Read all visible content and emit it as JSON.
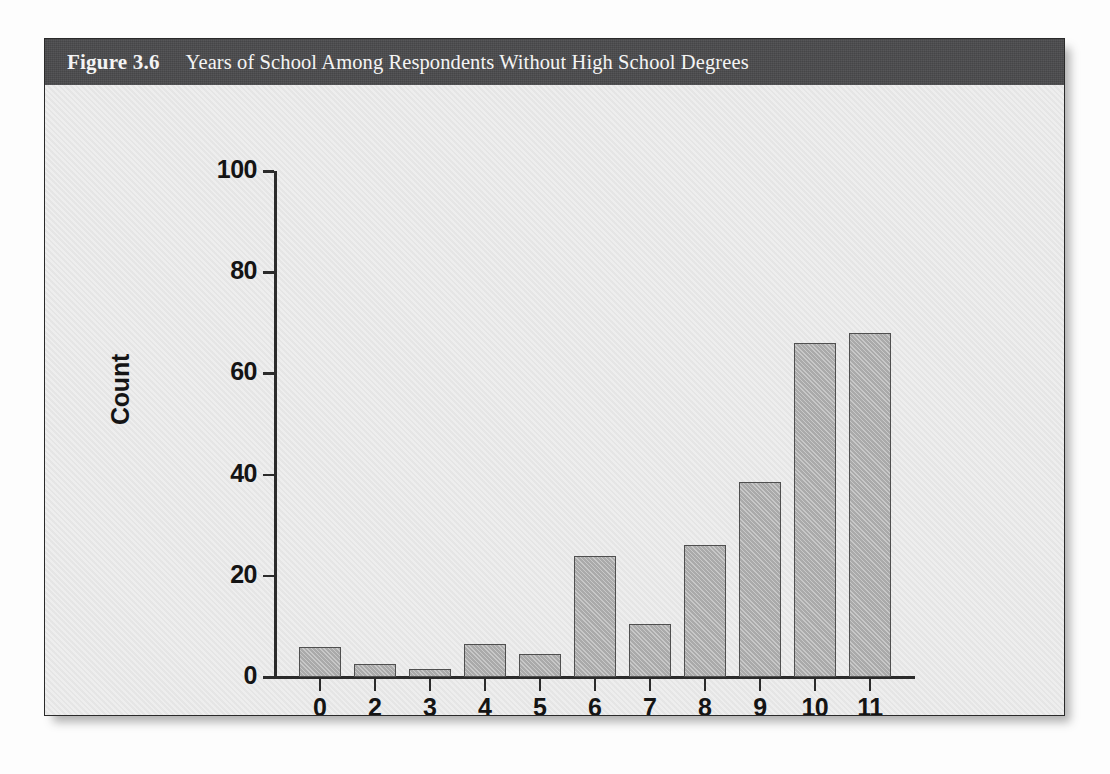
{
  "figure": {
    "number": "Figure 3.6",
    "title": "Years of School Among Respondents Without High School Degrees",
    "caption_bar_color": "#4a4a4c",
    "panel_color": "#e8e8e8",
    "bar_fill_color": "#b3b3b3",
    "bar_edge_color": "#4f4f4f",
    "axis_color": "#2b2b2b"
  },
  "chart_data": {
    "type": "bar",
    "title": "Years of School Among Respondents Without High School Degrees",
    "xlabel": "Highest Year of School Completed",
    "ylabel": "Count",
    "categories": [
      "0",
      "2",
      "3",
      "4",
      "5",
      "6",
      "7",
      "8",
      "9",
      "10",
      "11"
    ],
    "values": [
      6,
      2.5,
      1.5,
      6.5,
      4.5,
      24,
      10.5,
      26,
      38.5,
      66,
      68
    ],
    "ylim": [
      0,
      100
    ],
    "yticks": [
      0,
      20,
      40,
      60,
      80,
      100
    ],
    "ytick_labels": [
      "0",
      "20",
      "40",
      "60",
      "80",
      "100"
    ],
    "grid": false,
    "legend": null
  },
  "page_bleed": {
    "top_line": "",
    "right_block": ""
  }
}
